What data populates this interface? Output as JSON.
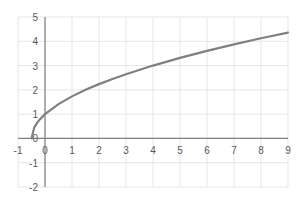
{
  "chart_data": {
    "type": "line",
    "title": "",
    "xlabel": "",
    "ylabel": "",
    "xlim": [
      -1,
      9
    ],
    "ylim": [
      -2,
      5
    ],
    "grid": true,
    "legend": "none",
    "x_ticks": [
      -1,
      0,
      1,
      2,
      3,
      4,
      5,
      6,
      7,
      8,
      9
    ],
    "y_ticks": [
      -2,
      -1,
      0,
      1,
      2,
      3,
      4,
      5
    ],
    "series": [
      {
        "name": "y = sqrt(2x+1)",
        "color": "#808080",
        "x": [
          -0.5,
          -0.4,
          -0.3,
          -0.2,
          0,
          0.5,
          1,
          1.5,
          2,
          2.5,
          3,
          4,
          5,
          6,
          7,
          8,
          9
        ],
        "values": [
          0,
          0.447,
          0.632,
          0.775,
          1,
          1.414,
          1.732,
          2,
          2.236,
          2.449,
          2.646,
          3,
          3.317,
          3.606,
          3.873,
          4.123,
          4.359
        ]
      }
    ]
  },
  "colors": {
    "grid": "#e6e6e6",
    "axis": "#808080",
    "curve": "#808080",
    "tick_text": "#595959"
  }
}
